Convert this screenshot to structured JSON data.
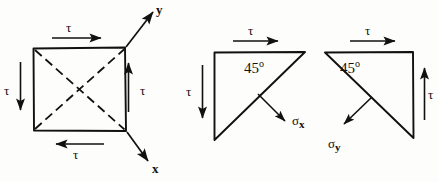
{
  "figure": {
    "type": "engineering-stress-diagram",
    "ink_color": "#111111",
    "background_color": "#fdfdfb",
    "panels": [
      {
        "name": "square-element",
        "shape": "square",
        "dashed_diagonals": 2,
        "labels": [
          "tau",
          "tau",
          "tau",
          "tau",
          "y",
          "x"
        ]
      },
      {
        "name": "triangle-sigma-x",
        "shape": "right-triangle",
        "angle": "45",
        "labels": [
          "tau",
          "tau",
          "45o",
          "sigma_x"
        ]
      },
      {
        "name": "triangle-sigma-y",
        "shape": "right-triangle",
        "angle": "45",
        "labels": [
          "tau",
          "tau",
          "45o",
          "sigma_y"
        ]
      }
    ]
  },
  "square_element": {
    "tau_top": "τ",
    "tau_left": "τ",
    "tau_right": "τ",
    "tau_bottom": "τ",
    "axis_y": "y",
    "axis_x": "x"
  },
  "triangle_x": {
    "tau_top": "τ",
    "tau_left": "τ",
    "angle_value": "45",
    "angle_unit": "o",
    "sigma_symbol": "σ",
    "sigma_subscript": "x"
  },
  "triangle_y": {
    "tau_top": "τ",
    "tau_right": "τ",
    "angle_value": "45",
    "angle_unit": "o",
    "sigma_symbol": "σ",
    "sigma_subscript": "y"
  }
}
